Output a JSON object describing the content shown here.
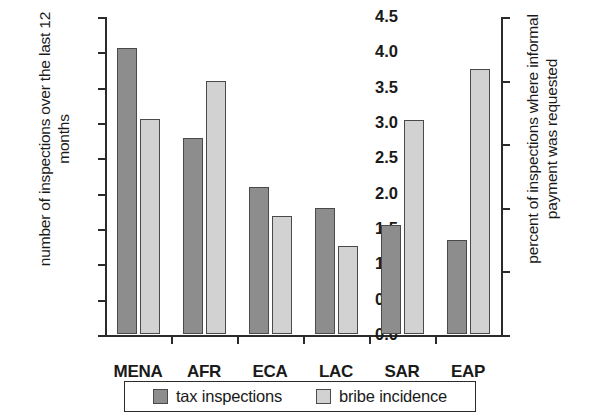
{
  "chart_data": {
    "type": "bar",
    "title": "",
    "subtitle": "",
    "categories": [
      "MENA",
      "AFR",
      "ECA",
      "LAC",
      "SAR",
      "EAP"
    ],
    "series": [
      {
        "name": "tax inspections",
        "axis": "left",
        "color": "#8d8d8d",
        "values": [
          4.05,
          2.77,
          2.08,
          1.79,
          1.54,
          1.33
        ]
      },
      {
        "name": "bribe incidence",
        "axis": "right",
        "color": "#d2d2d2",
        "values": [
          16.9,
          19.9,
          9.3,
          6.9,
          16.8,
          20.8
        ]
      }
    ],
    "xlabel": "",
    "ylabel": "number of inspections over the last 12 months",
    "ylabel_right": "percent of inspections where informal payment was requested",
    "ylim": [
      0,
      4.5
    ],
    "ylim_right": [
      0,
      25
    ],
    "yticks": [
      "0.0",
      "0.5",
      "1.0",
      "1.5",
      "2.0",
      "2.5",
      "3.0",
      "3.5",
      "4.0",
      "4.5"
    ],
    "ytick_values": [
      0,
      0.5,
      1.0,
      1.5,
      2.0,
      2.5,
      3.0,
      3.5,
      4.0,
      4.5
    ],
    "yticks_right": [
      "0",
      "5",
      "10",
      "15",
      "20",
      "25"
    ],
    "ytick_values_right": [
      0,
      5,
      10,
      15,
      20,
      25
    ],
    "grid": false,
    "legend_position": "bottom",
    "legend": [
      "tax inspections",
      "bribe incidence"
    ]
  }
}
